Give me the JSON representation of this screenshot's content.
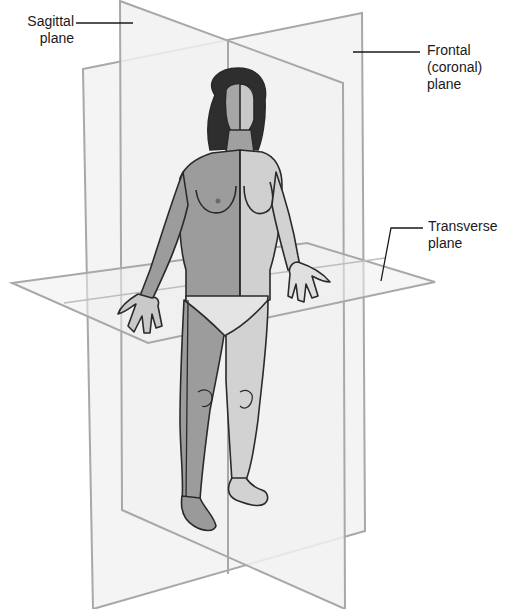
{
  "diagram": {
    "colors": {
      "plane_edge": "#a8a8a8",
      "plane_fill": "#f2f2f2",
      "leader": "#1a1a1a",
      "skin_dark": "#9a9a9a",
      "skin_light": "#cfcfcf",
      "hair": "#2e2e2e",
      "outline": "#2a2a2a"
    },
    "labels": [
      {
        "id": "sagittal",
        "lines": "Sagittal\nplane"
      },
      {
        "id": "frontal",
        "lines": "Frontal\n(coronal)\nplane"
      },
      {
        "id": "transverse",
        "lines": "Transverse\nplane"
      }
    ],
    "planes": [
      {
        "name": "Sagittal plane",
        "orientation": "vertical, front-to-back"
      },
      {
        "name": "Frontal (coronal) plane",
        "orientation": "vertical, side-to-side"
      },
      {
        "name": "Transverse plane",
        "orientation": "horizontal, at waist level"
      }
    ],
    "figure": "Standing female human figure in anatomical position, left half shaded darker than right half"
  }
}
